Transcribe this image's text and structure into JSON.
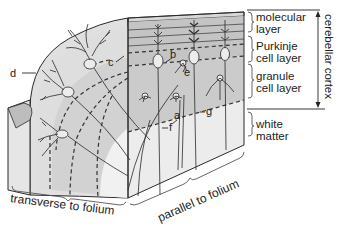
{
  "diagram": {
    "type": "anatomical block diagram",
    "subject": "cerebellar cortex",
    "colors": {
      "molecular_face": "#c4c4c4",
      "granule_face": "#cfcfcf",
      "white_matter_face": "#ececec",
      "top_face": "#d8d8d8",
      "stipple_face": "#e2e2e2",
      "ink": "#2a2a2a",
      "label_text": "#222222"
    },
    "layer_labels": {
      "molecular_1": "molecular",
      "molecular_2": "layer",
      "purkinje_1": "Purkinje",
      "purkinje_2": "cell layer",
      "granule_1": "granule",
      "granule_2": "cell layer",
      "white_1": "white",
      "white_2": "matter"
    },
    "cortex_label": "cerebellar cortex",
    "letters": {
      "a": "a",
      "b": "b",
      "c": "c",
      "d": "d",
      "e": "e",
      "f": "f",
      "g": "g"
    },
    "face_labels": {
      "transverse": "transverse to folium",
      "parallel": "parallel to folium"
    }
  }
}
